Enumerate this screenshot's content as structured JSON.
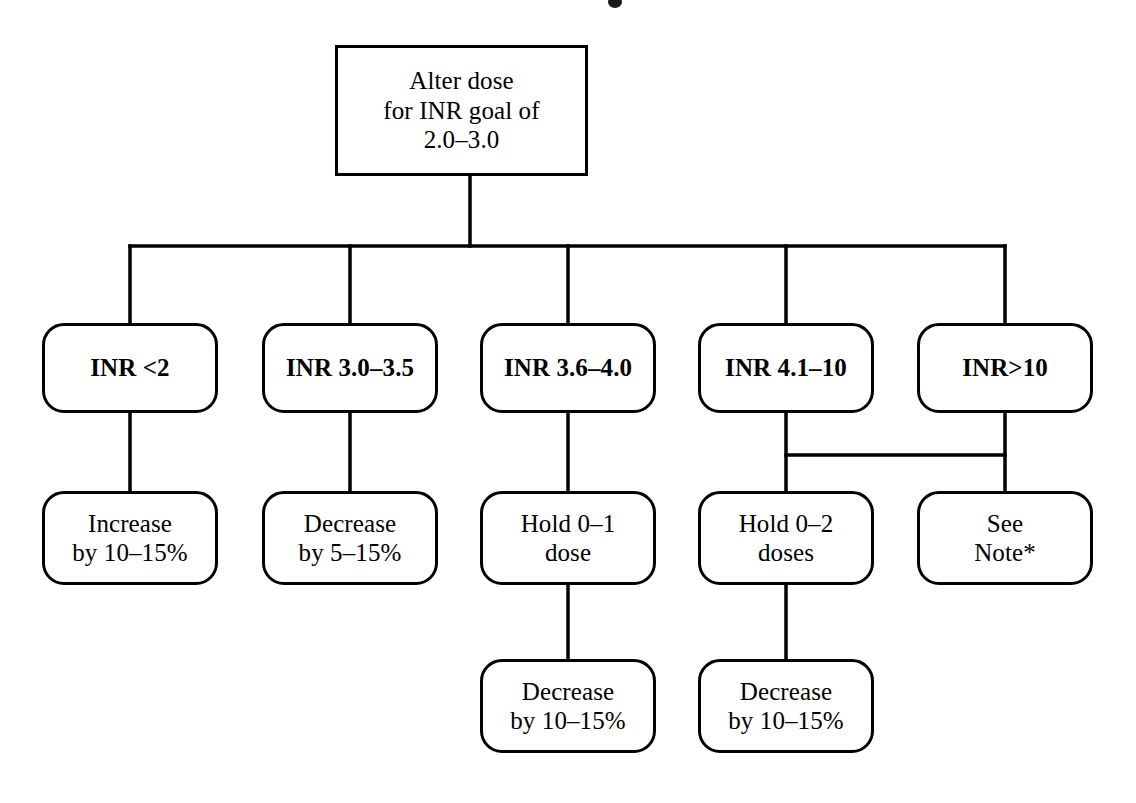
{
  "diagram": {
    "type": "flowchart",
    "stroke_color": "#000000",
    "background_color": "#ffffff",
    "root": {
      "id": "root",
      "label": "Alter dose\nfor INR goal of\n2.0–3.0",
      "shape": "rectangle"
    },
    "branches": [
      {
        "id": "branch-inr-lt-2",
        "condition": "INR <2",
        "actions": [
          {
            "id": "action-increase-10-15",
            "label": "Increase\nby 10–15%"
          }
        ]
      },
      {
        "id": "branch-inr-3-0-3-5",
        "condition": "INR 3.0–3.5",
        "actions": [
          {
            "id": "action-decrease-5-15",
            "label": "Decrease\nby 5–15%"
          }
        ]
      },
      {
        "id": "branch-inr-3-6-4-0",
        "condition": "INR 3.6–4.0",
        "actions": [
          {
            "id": "action-hold-0-1-dose",
            "label": "Hold 0–1\ndose"
          },
          {
            "id": "action-decrease-10-15-a",
            "label": "Decrease\nby 10–15%"
          }
        ]
      },
      {
        "id": "branch-inr-4-1-10",
        "condition": "INR 4.1–10",
        "actions": [
          {
            "id": "action-hold-0-2-doses",
            "label": "Hold 0–2\ndoses"
          },
          {
            "id": "action-decrease-10-15-b",
            "label": "Decrease\nby 10–15%"
          }
        ]
      },
      {
        "id": "branch-inr-gt-10",
        "condition": "INR>10",
        "actions": [
          {
            "id": "action-see-note",
            "label": "See\nNote*"
          }
        ]
      }
    ]
  }
}
